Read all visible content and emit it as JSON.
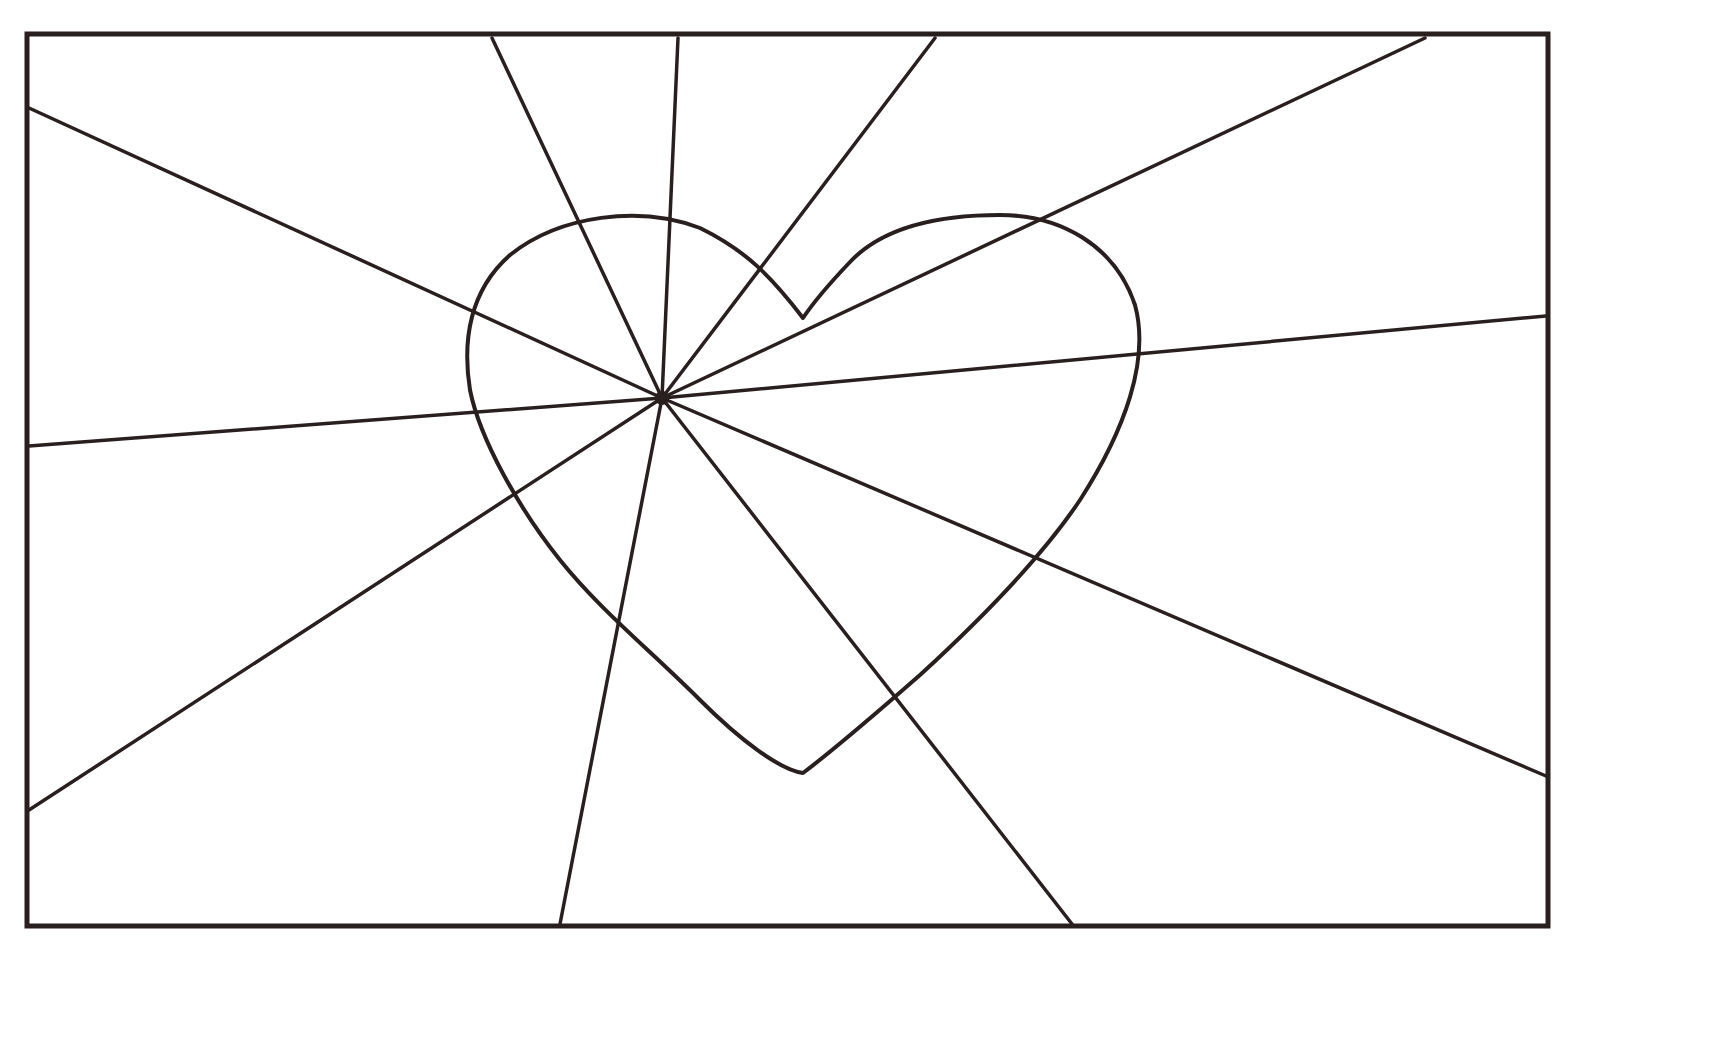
{
  "page": {
    "background": "#ffffff",
    "stroke_color": "#2a1f1f"
  },
  "frame": {
    "x": 27,
    "y": 34,
    "width": 1521,
    "height": 892,
    "stroke_width": 5
  },
  "center": {
    "x": 662,
    "y": 398,
    "r": 7
  },
  "heart": {
    "path": "M 803 318 C 770 275, 745 250, 700 228 C 640 205, 560 215, 510 255 C 470 290, 462 340, 470 390 C 480 440, 520 510, 560 560 C 600 610, 650 650, 700 700 C 740 740, 780 770, 803 773 C 840 745, 880 710, 920 675 C 980 620, 1040 560, 1080 500 C 1125 430, 1150 360, 1135 305 C 1115 245, 1060 215, 1000 215 C 930 215, 880 230, 850 262 C 830 283, 815 300, 803 318 Z",
    "stroke_width": 4
  },
  "rays": [
    {
      "name": "ray-top-left-1",
      "x2": 492,
      "y2": 38
    },
    {
      "name": "ray-top",
      "x2": 678,
      "y2": 38
    },
    {
      "name": "ray-top-right-1",
      "x2": 935,
      "y2": 38
    },
    {
      "name": "ray-top-right-2",
      "x2": 1425,
      "y2": 38
    },
    {
      "name": "ray-left-upper",
      "x2": 29,
      "y2": 108
    },
    {
      "name": "ray-right-upper",
      "x2": 1546,
      "y2": 316
    },
    {
      "name": "ray-left-middle",
      "x2": 29,
      "y2": 446
    },
    {
      "name": "ray-left-lower",
      "x2": 29,
      "y2": 810
    },
    {
      "name": "ray-bottom-left",
      "x2": 560,
      "y2": 924
    },
    {
      "name": "ray-bottom-right",
      "x2": 1072,
      "y2": 924
    },
    {
      "name": "ray-right-lower",
      "x2": 1546,
      "y2": 776
    }
  ]
}
